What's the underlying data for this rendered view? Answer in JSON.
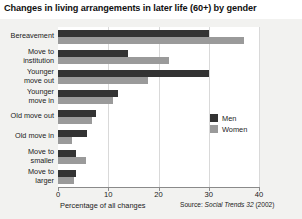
{
  "title": "Changes in living arrangements in later life (60+) by gender",
  "axis": {
    "xlabel": "Percentage of all changes",
    "ticks": [
      "0",
      "10",
      "20",
      "30",
      "40"
    ],
    "tick_values": [
      0,
      10,
      20,
      30,
      40
    ]
  },
  "source": {
    "prefix": "Source: ",
    "italic": "Social Trends 32",
    "suffix": " (2002)"
  },
  "legend": {
    "position": "right-middle",
    "entries": [
      {
        "label": "Men",
        "color": "#333333"
      },
      {
        "label": "Women",
        "color": "#9a9a9a"
      }
    ]
  },
  "chart_data": {
    "type": "bar",
    "orientation": "horizontal",
    "title": "Changes in living arrangements in later life (60+) by gender",
    "xlabel": "Percentage of all changes",
    "ylabel": "",
    "xlim": [
      0,
      40
    ],
    "grid": true,
    "categories": [
      "Bereavement",
      "Move to institution",
      "Younger move out",
      "Younger move in",
      "Old move out",
      "Old move in",
      "Move to smaller",
      "Move to larger"
    ],
    "category_lines": [
      [
        "Bereavement"
      ],
      [
        "Move to",
        "institution"
      ],
      [
        "Younger",
        "move out"
      ],
      [
        "Younger",
        "move in"
      ],
      [
        "Old move out"
      ],
      [
        "Old move in"
      ],
      [
        "Move to",
        "smaller"
      ],
      [
        "Move to",
        "larger"
      ]
    ],
    "series": [
      {
        "name": "Men",
        "color": "#333333",
        "values": [
          30,
          14,
          30,
          12,
          7.5,
          5.7,
          3.6,
          3.6
        ]
      },
      {
        "name": "Women",
        "color": "#9a9a9a",
        "values": [
          37,
          22,
          18,
          11,
          6.7,
          2.7,
          5.6,
          3.1
        ]
      }
    ]
  }
}
